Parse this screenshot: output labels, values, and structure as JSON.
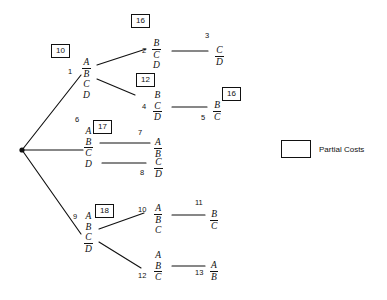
{
  "diagram": {
    "line_color": "#111111",
    "background": "#ffffff"
  },
  "legend": {
    "label": "Partial Costs",
    "swatch_name": "partial-cost-box"
  },
  "root": {
    "name": "root-node",
    "x": 22,
    "y": 150
  },
  "nodes": [
    {
      "id": "1",
      "index_label": "1",
      "cost": "10",
      "letters": [
        {
          "text": "A",
          "bar": true
        },
        {
          "text": "B",
          "bar": false
        },
        {
          "text": "C",
          "bar": false
        },
        {
          "text": "D",
          "bar": false
        }
      ]
    },
    {
      "id": "2",
      "index_label": "2",
      "cost": "16",
      "letters": [
        {
          "text": "B",
          "bar": true
        },
        {
          "text": "C",
          "bar": false
        },
        {
          "text": "D",
          "bar": false
        }
      ]
    },
    {
      "id": "3",
      "index_label": "3",
      "cost": "",
      "letters": [
        {
          "text": "C",
          "bar": true
        },
        {
          "text": "D",
          "bar": false
        }
      ]
    },
    {
      "id": "4",
      "index_label": "4",
      "cost": "12",
      "letters": [
        {
          "text": "B",
          "bar": false
        },
        {
          "text": "C",
          "bar": true
        },
        {
          "text": "D",
          "bar": false
        }
      ]
    },
    {
      "id": "5",
      "index_label": "5",
      "cost": "16",
      "letters": [
        {
          "text": "B",
          "bar": true
        },
        {
          "text": "C",
          "bar": false
        }
      ]
    },
    {
      "id": "6",
      "index_label": "6",
      "cost": "17",
      "letters": [
        {
          "text": "A",
          "bar": false
        },
        {
          "text": "B",
          "bar": true
        },
        {
          "text": "C",
          "bar": false
        },
        {
          "text": "D",
          "bar": false
        }
      ]
    },
    {
      "id": "7",
      "index_label": "7",
      "cost": "",
      "letters": [
        {
          "text": "A",
          "bar": true
        },
        {
          "text": "B",
          "bar": false
        }
      ]
    },
    {
      "id": "8",
      "index_label": "8",
      "cost": "",
      "letters": [
        {
          "text": "C",
          "bar": true
        },
        {
          "text": "D",
          "bar": false
        }
      ]
    },
    {
      "id": "9",
      "index_label": "9",
      "cost": "18",
      "letters": [
        {
          "text": "A",
          "bar": false
        },
        {
          "text": "B",
          "bar": false
        },
        {
          "text": "C",
          "bar": true
        },
        {
          "text": "D",
          "bar": false
        }
      ]
    },
    {
      "id": "10",
      "index_label": "10",
      "cost": "",
      "letters": [
        {
          "text": "A",
          "bar": true
        },
        {
          "text": "B",
          "bar": false
        },
        {
          "text": "C",
          "bar": false
        }
      ]
    },
    {
      "id": "11",
      "index_label": "11",
      "cost": "",
      "letters": [
        {
          "text": "B",
          "bar": true
        },
        {
          "text": "C",
          "bar": false
        }
      ]
    },
    {
      "id": "12",
      "index_label": "12",
      "cost": "",
      "letters": [
        {
          "text": "A",
          "bar": false
        },
        {
          "text": "B",
          "bar": true
        },
        {
          "text": "C",
          "bar": false
        }
      ]
    },
    {
      "id": "13",
      "index_label": "13",
      "cost": "",
      "letters": [
        {
          "text": "A",
          "bar": true
        },
        {
          "text": "B",
          "bar": false
        }
      ]
    }
  ],
  "edges": [
    {
      "from": "root",
      "to": "1"
    },
    {
      "from": "root",
      "to": "6"
    },
    {
      "from": "root",
      "to": "9"
    },
    {
      "from": "1",
      "to": "2"
    },
    {
      "from": "1",
      "to": "4"
    },
    {
      "from": "2",
      "to": "3"
    },
    {
      "from": "4",
      "to": "5"
    },
    {
      "from": "6",
      "to": "7"
    },
    {
      "from": "6",
      "to": "8"
    },
    {
      "from": "9",
      "to": "10"
    },
    {
      "from": "9",
      "to": "12"
    },
    {
      "from": "10",
      "to": "11"
    },
    {
      "from": "12",
      "to": "13"
    }
  ]
}
